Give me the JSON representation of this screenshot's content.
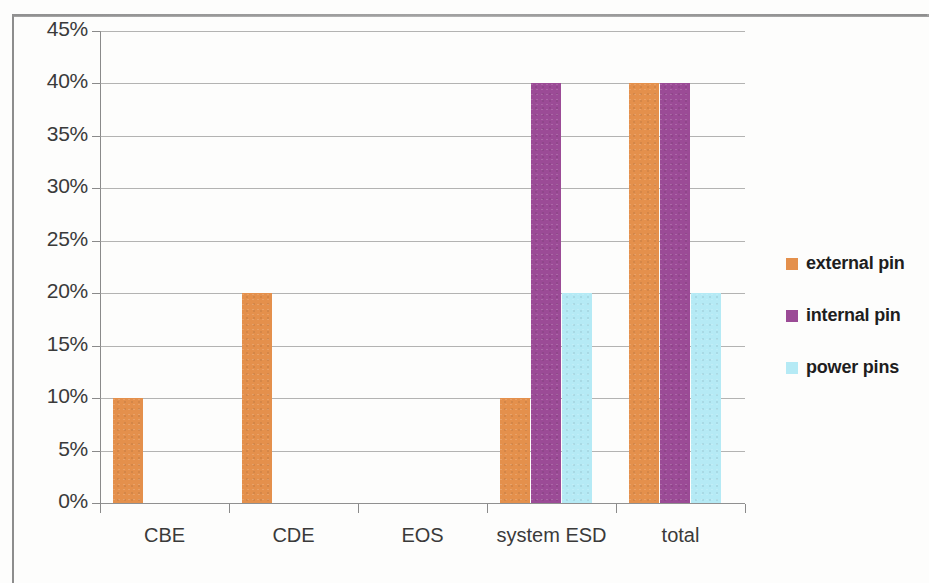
{
  "chart_data": {
    "type": "bar",
    "title": "",
    "subtitle": "",
    "xlabel": "",
    "ylabel": "",
    "categories": [
      "CBE",
      "CDE",
      "EOS",
      "system ESD",
      "total"
    ],
    "series": [
      {
        "name": "external pin",
        "color": "#e4904c",
        "values": [
          10,
          20,
          0,
          10,
          40
        ]
      },
      {
        "name": "internal pin",
        "color": "#9b4b96",
        "values": [
          0,
          0,
          0,
          40,
          40
        ]
      },
      {
        "name": "power pins",
        "color": "#b5eaf5",
        "values": [
          0,
          0,
          0,
          20,
          20
        ]
      }
    ],
    "ylim": [
      0,
      45
    ],
    "ytick_values": [
      0,
      5,
      10,
      15,
      20,
      25,
      30,
      35,
      40,
      45
    ],
    "ytick_labels": [
      "0%",
      "5%",
      "10%",
      "15%",
      "20%",
      "25%",
      "30%",
      "35%",
      "40%",
      "45%"
    ],
    "grid": true,
    "legend_position": "right",
    "value_format": "percent"
  },
  "axis": {
    "y": {
      "ticks": [
        "45%",
        "40%",
        "35%",
        "30%",
        "25%",
        "20%",
        "15%",
        "10%",
        "5%",
        "0%"
      ]
    },
    "x": {
      "categories": [
        "CBE",
        "CDE",
        "EOS",
        "system ESD",
        "total"
      ]
    }
  },
  "legend": {
    "entries": [
      {
        "label": "external pin",
        "color": "#e4904c"
      },
      {
        "label": "internal pin",
        "color": "#9b4b96"
      },
      {
        "label": "power pins",
        "color": "#b5eaf5"
      }
    ]
  },
  "colors": {
    "external_pin": "#e4904c",
    "internal_pin": "#9b4b96",
    "power_pins": "#b5eaf5",
    "gridline": "#9a9a9a",
    "axis": "#8a8a8a",
    "text": "#3a3a3a",
    "background": "#fdfdfc"
  }
}
